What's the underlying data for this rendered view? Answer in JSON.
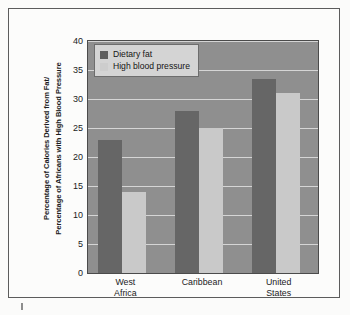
{
  "chart_data": {
    "type": "bar",
    "title": "",
    "subtitle": "",
    "xlabel": "",
    "ylabel": "Percentage of Calories Derived from Fat/\nPercentage of Africans with High Blood Pressure",
    "ylabel_line1": "Percentage of Calories Derived from Fat/",
    "ylabel_line2": "Percentage of Africans with High Blood Pressure",
    "categories": [
      "West Africa",
      "Caribbean",
      "United States"
    ],
    "category_lines": [
      [
        "West",
        "Africa"
      ],
      [
        "Caribbean"
      ],
      [
        "United",
        "States"
      ]
    ],
    "series": [
      {
        "name": "Dietary fat",
        "values": [
          23,
          28,
          33.5
        ],
        "color": "#666666"
      },
      {
        "name": "High blood pressure",
        "values": [
          14,
          25,
          31
        ],
        "color": "#c9c9c9"
      }
    ],
    "ylim": [
      0,
      40
    ],
    "yticks": [
      0,
      5,
      10,
      15,
      20,
      25,
      30,
      35,
      40
    ],
    "ytick_labels": [
      "0",
      "5",
      "10",
      "15",
      "20",
      "25",
      "30",
      "35",
      "40"
    ],
    "grid": true,
    "grid_axis": "y",
    "legend_position": "top-left",
    "plot_background": "#8f8f8f",
    "gridline_color": "#e2e2e2",
    "frame_color": "#5c5c5c",
    "page_background": "#fbfbfa"
  },
  "legend": {
    "items": [
      {
        "label": "Dietary fat",
        "swatch": "dark"
      },
      {
        "label": "High blood pressure",
        "swatch": "light"
      }
    ]
  }
}
